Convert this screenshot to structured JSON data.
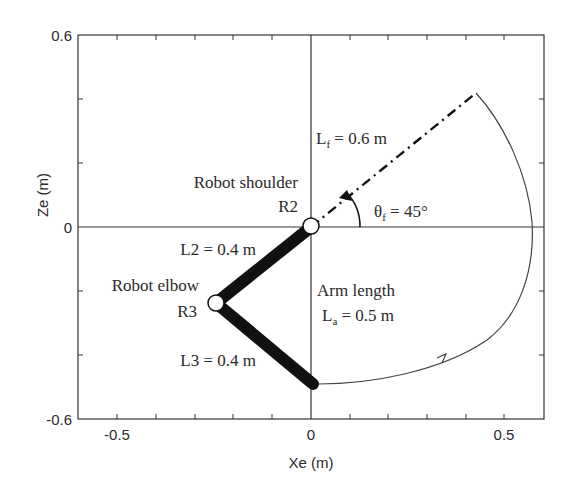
{
  "figure": {
    "type": "robot-arm-kinematics-diagram",
    "x_axis": {
      "label": "Xe (m)",
      "range": [
        -0.6,
        0.6
      ],
      "tick_labels": [
        "-0.5",
        "0",
        "0.5"
      ],
      "ticks": [
        -0.5,
        -0.4,
        -0.3,
        -0.2,
        -0.1,
        0,
        0.1,
        0.2,
        0.3,
        0.4,
        0.5
      ]
    },
    "y_axis": {
      "label": "Ze (m)",
      "range": [
        -0.6,
        0.6
      ],
      "tick_labels": [
        "0.6",
        "0",
        "-0.6"
      ],
      "ticks": [
        -0.4,
        -0.2,
        0,
        0.2,
        0.4
      ]
    },
    "annotations": {
      "shoulder_label": "Robot shoulder",
      "shoulder_joint": "R2",
      "elbow_label": "Robot elbow",
      "elbow_joint": "R3",
      "l2": "L2 = 0.4 m",
      "l3": "L3 = 0.4 m",
      "arm_length_title": "Arm length",
      "arm_length_sym": "L",
      "arm_length_sub": "a",
      "arm_length_val": " = 0.5 m",
      "lf_sym": "L",
      "lf_sub": "f",
      "lf_val": " = 0.6 m",
      "theta_sym": "θ",
      "theta_sub": "f",
      "theta_val": " = 45°"
    },
    "geometry": {
      "shoulder": [
        0,
        0
      ],
      "elbow": [
        -0.246,
        -0.238
      ],
      "end_effector": [
        0.005,
        -0.49
      ],
      "forearm_target_end": [
        0.424,
        0.424
      ],
      "theta_f_deg": 45
    },
    "colors": {
      "line": "#2a2a2a",
      "arm": "#111111",
      "background": "#ffffff"
    }
  }
}
